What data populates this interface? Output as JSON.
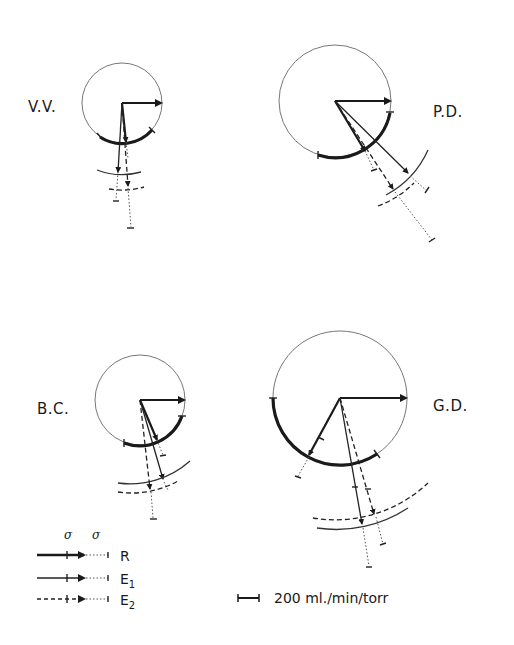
{
  "figure": {
    "panels": [
      {
        "id": "vv",
        "label": "V.V."
      },
      {
        "id": "pd",
        "label": "P.D."
      },
      {
        "id": "bc",
        "label": "B.C."
      },
      {
        "id": "gd",
        "label": "G.D."
      }
    ],
    "legend": {
      "sigma_header_1": "σ",
      "sigma_header_2": "σ",
      "items": [
        {
          "key": "R",
          "label": "R",
          "style": "thick solid"
        },
        {
          "key": "E1",
          "label": "E",
          "subscript": "1",
          "style": "thin solid"
        },
        {
          "key": "E2",
          "label": "E",
          "subscript": "2",
          "style": "dashed"
        }
      ]
    },
    "scale_bar": {
      "label": "200 ml./min/torr"
    },
    "colors": {
      "ink": "#1a1a1a",
      "circle": "#777777",
      "background": "#ffffff"
    }
  }
}
